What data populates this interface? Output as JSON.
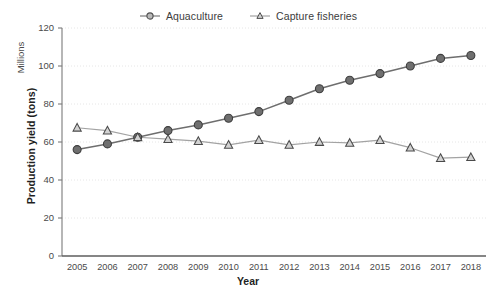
{
  "chart_data": {
    "type": "line",
    "title": "",
    "xlabel": "Year",
    "ylabel": "Production yield (tons)",
    "units_label": "Millions",
    "categories": [
      "2005",
      "2006",
      "2007",
      "2008",
      "2009",
      "2010",
      "2011",
      "2012",
      "2013",
      "2014",
      "2015",
      "2016",
      "2017",
      "2018"
    ],
    "ylim": [
      0,
      120
    ],
    "yticks": [
      0,
      20,
      40,
      60,
      80,
      100,
      120
    ],
    "grid": true,
    "legend_position": "top-center",
    "series": [
      {
        "name": "Aquaculture",
        "marker": "circle",
        "color": "#5a5a5a",
        "values": [
          56,
          59,
          62.5,
          66,
          69,
          72.5,
          76,
          82,
          88,
          92.5,
          96,
          100,
          104,
          105.5
        ]
      },
      {
        "name": "Capture fisheries",
        "marker": "triangle",
        "color": "#9a9a9a",
        "values": [
          67.5,
          66,
          62.5,
          61.5,
          60.5,
          58.5,
          61,
          58.5,
          60,
          59.5,
          61,
          57,
          51.5,
          52
        ]
      }
    ]
  },
  "legend": {
    "items": [
      {
        "label": "Aquaculture"
      },
      {
        "label": "Capture fisheries"
      }
    ]
  },
  "axes": {
    "x_title": "Year",
    "y_title": "Production yield (tons)",
    "y_units": "Millions"
  }
}
